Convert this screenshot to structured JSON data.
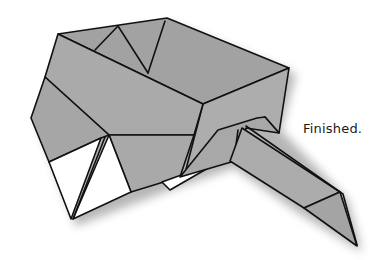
{
  "diagram": {
    "caption": "Finished.",
    "colors": {
      "paper_colored": "#a9a9a9",
      "paper_colored_light": "#b3b3b3",
      "paper_colored_dark": "#9c9c9c",
      "paper_white": "#ffffff",
      "outline": "#111111",
      "shadow": "#6e6e6e"
    },
    "parts": [
      {
        "name": "box-interior-back-wall",
        "side": "colored"
      },
      {
        "name": "box-interior-right-wall",
        "side": "colored"
      },
      {
        "name": "box-front-rim-flap",
        "side": "colored"
      },
      {
        "name": "box-left-side",
        "side": "colored"
      },
      {
        "name": "box-front-face",
        "side": "colored"
      },
      {
        "name": "white-triangle-left",
        "side": "white"
      },
      {
        "name": "white-triangle-right",
        "side": "white"
      },
      {
        "name": "handle-strip",
        "side": "colored"
      },
      {
        "name": "handle-tip",
        "side": "colored"
      },
      {
        "name": "white-sliver",
        "side": "white"
      }
    ]
  }
}
